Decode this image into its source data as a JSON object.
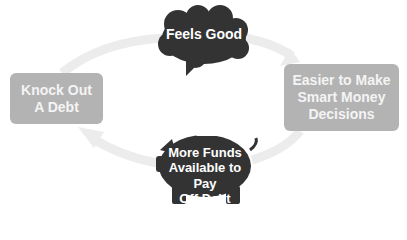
{
  "diagram": {
    "type": "cycle",
    "nodes": [
      {
        "id": "knock-out",
        "label_lines": [
          "Knock Out",
          "A Debt"
        ],
        "shape": "rounded-box",
        "position": "left"
      },
      {
        "id": "feels-good",
        "label_lines": [
          "Feels Good"
        ],
        "shape": "brain-icon",
        "position": "top"
      },
      {
        "id": "easier",
        "label_lines": [
          "Easier to Make",
          "Smart Money",
          "Decisions"
        ],
        "shape": "rounded-box",
        "position": "right"
      },
      {
        "id": "more-funds",
        "label_lines": [
          "More Funds",
          "Available to Pay",
          "Off Debt"
        ],
        "shape": "piggy-bank-icon",
        "position": "bottom"
      }
    ],
    "edges": [
      {
        "from": "knock-out",
        "to": "feels-good"
      },
      {
        "from": "feels-good",
        "to": "easier"
      },
      {
        "from": "easier",
        "to": "more-funds"
      },
      {
        "from": "more-funds",
        "to": "knock-out"
      }
    ],
    "colors": {
      "box_fill": "#b3b3b3",
      "box_text": "#f4f4f4",
      "icon_fill": "#333333",
      "icon_text": "#ffffff",
      "arrow": "#ececec"
    }
  }
}
